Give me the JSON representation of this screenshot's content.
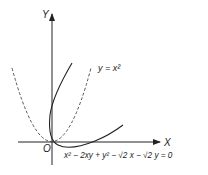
{
  "diagram": {
    "axes": {
      "x_label": "X",
      "y_label": "Y",
      "origin_label": "O"
    },
    "curves": [
      {
        "name": "parabola",
        "equation_label": "y = x²",
        "style": "dashed"
      },
      {
        "name": "rotated-parabola",
        "equation_label": "x² − 2xy + y² − √2 x − √2 y = 0",
        "style": "solid"
      }
    ]
  }
}
